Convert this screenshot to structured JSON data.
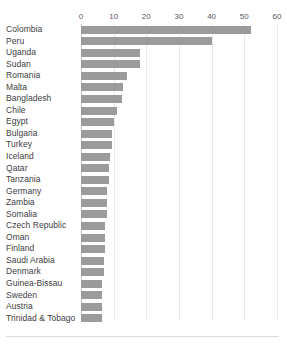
{
  "title_fragment": "",
  "axis": {
    "ticks": [
      0,
      10,
      20,
      30,
      40,
      50,
      60
    ],
    "tick_labels": [
      "0",
      "10",
      "20",
      "30",
      "40",
      "50",
      "60"
    ]
  },
  "chart_data": {
    "type": "bar",
    "orientation": "horizontal",
    "title": "",
    "subtitle": "",
    "xlabel": "",
    "ylabel": "",
    "xlim": [
      0,
      60
    ],
    "grid": true,
    "legend": "none",
    "bar_color": "#9b9b9b",
    "gridline_color": "#e9e9e9",
    "axis_color": "#c9c9c9",
    "categories": [
      "Colombia",
      "Peru",
      "Uganda",
      "Sudan",
      "Romania",
      "Malta",
      "Bangladesh",
      "Chile",
      "Egypt",
      "Bulgaria",
      "Turkey",
      "Iceland",
      "Qatar",
      "Tanzania",
      "Germany",
      "Zambia",
      "Somalia",
      "Czech Republic",
      "Oman",
      "Finland",
      "Saudi Arabia",
      "Denmark",
      "Guinea-Bissau",
      "Sweden",
      "Austria",
      "Trinidad & Tobago"
    ],
    "values": [
      52,
      40,
      18,
      18,
      14,
      13,
      12.5,
      11,
      10,
      9.5,
      9.5,
      9,
      8.5,
      8.5,
      8,
      8,
      8,
      7.5,
      7.5,
      7.5,
      7,
      7,
      6.5,
      6.5,
      6.5,
      6.5
    ]
  }
}
